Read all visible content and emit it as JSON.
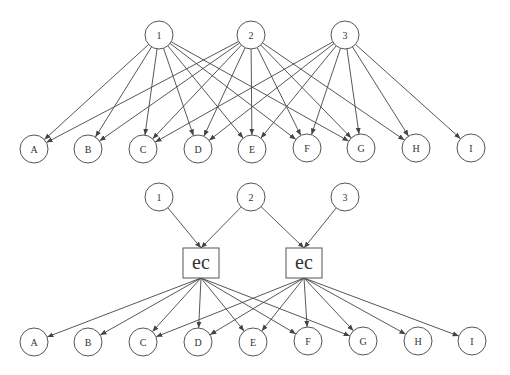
{
  "colors": {
    "stroke": "#555555",
    "edge": "#444444",
    "text": "#333333",
    "background": "#ffffff"
  },
  "top_graph": {
    "sources": [
      {
        "id": "1",
        "label": "1",
        "x": 159,
        "y": 35
      },
      {
        "id": "2",
        "label": "2",
        "x": 251,
        "y": 35
      },
      {
        "id": "3",
        "label": "3",
        "x": 345,
        "y": 35
      }
    ],
    "targets": [
      {
        "id": "A",
        "label": "A",
        "x": 34,
        "y": 149
      },
      {
        "id": "B",
        "label": "B",
        "x": 88,
        "y": 149
      },
      {
        "id": "C",
        "label": "C",
        "x": 143,
        "y": 149
      },
      {
        "id": "D",
        "label": "D",
        "x": 198,
        "y": 149
      },
      {
        "id": "E",
        "label": "E",
        "x": 252,
        "y": 149
      },
      {
        "id": "F",
        "label": "F",
        "x": 307,
        "y": 148
      },
      {
        "id": "G",
        "label": "G",
        "x": 361,
        "y": 148
      },
      {
        "id": "H",
        "label": "H",
        "x": 416,
        "y": 148
      },
      {
        "id": "I",
        "label": "I",
        "x": 471,
        "y": 148
      }
    ],
    "edges": [
      [
        "1",
        "A"
      ],
      [
        "1",
        "B"
      ],
      [
        "1",
        "C"
      ],
      [
        "1",
        "D"
      ],
      [
        "1",
        "E"
      ],
      [
        "1",
        "F"
      ],
      [
        "1",
        "G"
      ],
      [
        "2",
        "A"
      ],
      [
        "2",
        "B"
      ],
      [
        "2",
        "C"
      ],
      [
        "2",
        "D"
      ],
      [
        "2",
        "E"
      ],
      [
        "2",
        "F"
      ],
      [
        "2",
        "G"
      ],
      [
        "2",
        "H"
      ],
      [
        "3",
        "C"
      ],
      [
        "3",
        "D"
      ],
      [
        "3",
        "E"
      ],
      [
        "3",
        "F"
      ],
      [
        "3",
        "G"
      ],
      [
        "3",
        "H"
      ],
      [
        "3",
        "I"
      ]
    ]
  },
  "bottom_graph": {
    "sources": [
      {
        "id": "1",
        "label": "1",
        "x": 159,
        "y": 197
      },
      {
        "id": "2",
        "label": "2",
        "x": 251,
        "y": 197
      },
      {
        "id": "3",
        "label": "3",
        "x": 345,
        "y": 197
      }
    ],
    "boxes": [
      {
        "id": "ec1",
        "label": "ec",
        "x": 201,
        "y": 263,
        "w": 36,
        "h": 30
      },
      {
        "id": "ec2",
        "label": "ec",
        "x": 304,
        "y": 263,
        "w": 36,
        "h": 30
      }
    ],
    "targets": [
      {
        "id": "A",
        "label": "A",
        "x": 34,
        "y": 342
      },
      {
        "id": "B",
        "label": "B",
        "x": 88,
        "y": 342
      },
      {
        "id": "C",
        "label": "C",
        "x": 143,
        "y": 342
      },
      {
        "id": "D",
        "label": "D",
        "x": 198,
        "y": 342
      },
      {
        "id": "E",
        "label": "E",
        "x": 253,
        "y": 342
      },
      {
        "id": "F",
        "label": "F",
        "x": 308,
        "y": 341
      },
      {
        "id": "G",
        "label": "G",
        "x": 363,
        "y": 341
      },
      {
        "id": "H",
        "label": "H",
        "x": 418,
        "y": 341
      },
      {
        "id": "I",
        "label": "I",
        "x": 472,
        "y": 341
      }
    ],
    "input_edges": [
      [
        "1",
        "ec1"
      ],
      [
        "2",
        "ec1"
      ],
      [
        "2",
        "ec2"
      ],
      [
        "3",
        "ec2"
      ]
    ],
    "output_edges": [
      [
        "ec1",
        "A"
      ],
      [
        "ec1",
        "B"
      ],
      [
        "ec1",
        "C"
      ],
      [
        "ec1",
        "D"
      ],
      [
        "ec1",
        "E"
      ],
      [
        "ec1",
        "F"
      ],
      [
        "ec1",
        "G"
      ],
      [
        "ec2",
        "C"
      ],
      [
        "ec2",
        "D"
      ],
      [
        "ec2",
        "E"
      ],
      [
        "ec2",
        "F"
      ],
      [
        "ec2",
        "G"
      ],
      [
        "ec2",
        "H"
      ],
      [
        "ec2",
        "I"
      ]
    ]
  },
  "node_radius": 14
}
